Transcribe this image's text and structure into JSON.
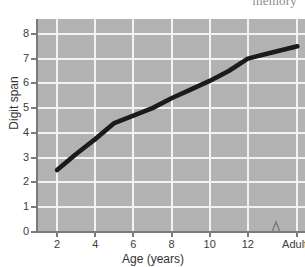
{
  "cropped_caption": "memory",
  "chart_data": {
    "type": "line",
    "title": "",
    "xlabel": "Age (years)",
    "ylabel": "Digit span",
    "grid": true,
    "legend": null,
    "background_color": "#b2b2b2",
    "gridline_color": "#f2f2f2",
    "line_color": "#1b1b1b",
    "xlim": [
      1,
      15
    ],
    "ylim": [
      0,
      8.6
    ],
    "x_tick_labels": [
      "2",
      "4",
      "6",
      "8",
      "10",
      "12",
      "Adults"
    ],
    "x_tick_values": [
      2,
      4,
      6,
      8,
      10,
      12,
      14.6
    ],
    "y_tick_labels": [
      "0",
      "1",
      "2",
      "3",
      "4",
      "5",
      "6",
      "7",
      "8"
    ],
    "y_tick_values": [
      0,
      1,
      2,
      3,
      4,
      5,
      6,
      7,
      8
    ],
    "axis_break": {
      "present": true,
      "axis": "x",
      "between": [
        13,
        14
      ]
    },
    "x": [
      2,
      3,
      4,
      5,
      6,
      7,
      8,
      9,
      10,
      11,
      12,
      13,
      14.6
    ],
    "y": [
      2.5,
      3.15,
      3.75,
      4.4,
      4.7,
      5.0,
      5.4,
      5.75,
      6.1,
      6.5,
      7.0,
      7.2,
      7.5
    ],
    "series": [
      {
        "name": "Digit span by age",
        "values": [
          2.5,
          3.15,
          3.75,
          4.4,
          4.7,
          5.0,
          5.4,
          5.75,
          6.1,
          6.5,
          7.0,
          7.2,
          7.5
        ]
      }
    ]
  }
}
